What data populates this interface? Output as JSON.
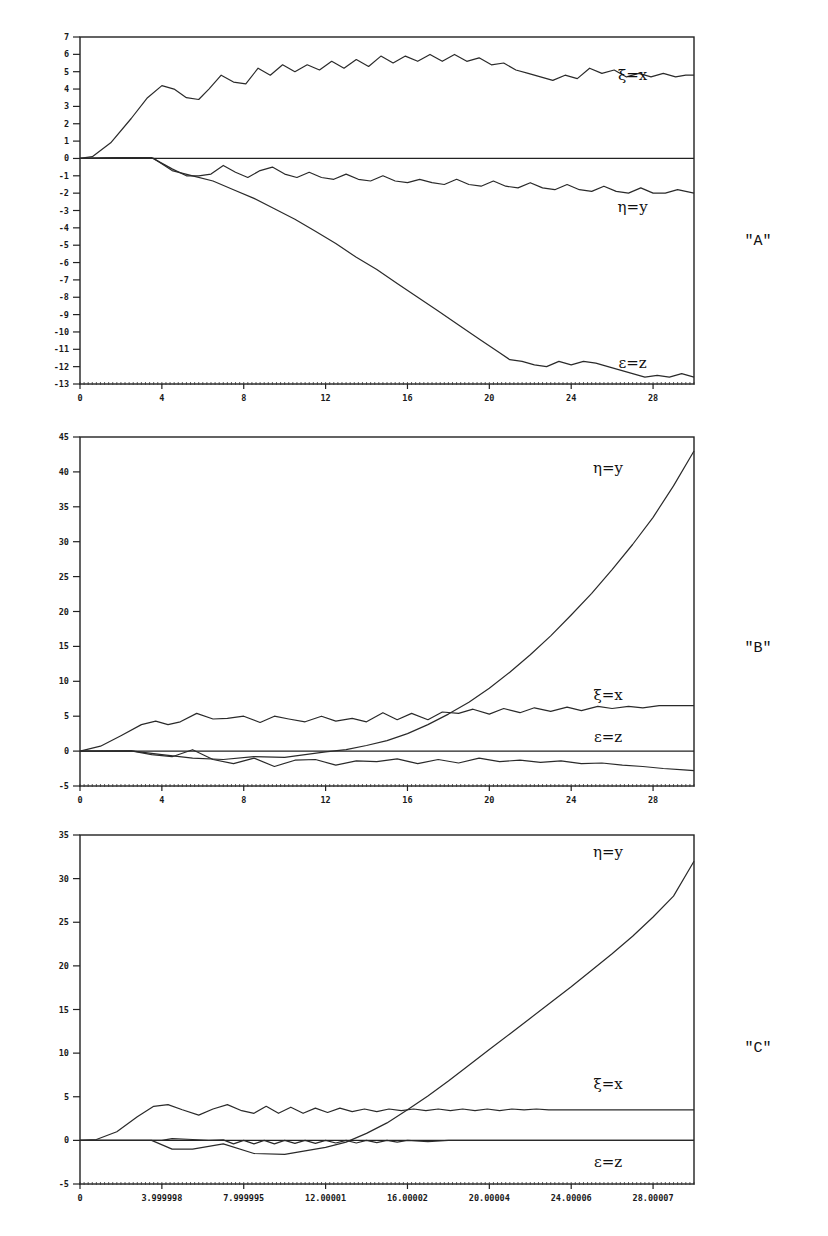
{
  "chart_data": [
    {
      "panel": "\"A\"",
      "type": "line",
      "frame": {
        "left": 80,
        "right": 694,
        "top": 37,
        "bottom": 384
      },
      "xlim": [
        0,
        30
      ],
      "ylim": [
        -13,
        7
      ],
      "x_ticks": [
        0,
        4,
        8,
        12,
        16,
        20,
        24,
        28
      ],
      "x_tick_labels": [
        "0",
        "4",
        "8",
        "12",
        "16",
        "20",
        "24",
        "28"
      ],
      "y_ticks": [
        7,
        6,
        5,
        4,
        3,
        2,
        1,
        0,
        -1,
        -2,
        -3,
        -4,
        -5,
        -6,
        -7,
        -8,
        -9,
        -10,
        -11,
        -12,
        -13
      ],
      "y_tick_labels": [
        "7",
        "6",
        "5",
        "4",
        "3",
        "2",
        "1",
        "0",
        "-1",
        "-2",
        "-3",
        "-4",
        "-5",
        "-6",
        "-7",
        "-8",
        "-9",
        "-10",
        "-11",
        "-12",
        "-13"
      ],
      "zero_line": true,
      "series": [
        {
          "name": "ξ=x",
          "label_pos": [
            0.9,
            4.8
          ],
          "x": [
            0,
            0.6,
            1.5,
            2.5,
            3.3,
            4.0,
            4.6,
            5.2,
            5.8,
            6.3,
            6.9,
            7.5,
            8.1,
            8.7,
            9.3,
            9.9,
            10.5,
            11.1,
            11.7,
            12.3,
            12.9,
            13.5,
            14.1,
            14.7,
            15.3,
            15.9,
            16.5,
            17.1,
            17.7,
            18.3,
            18.9,
            19.5,
            20.1,
            20.7,
            21.3,
            21.9,
            22.5,
            23.1,
            23.7,
            24.3,
            24.9,
            25.5,
            26.1,
            26.7,
            27.3,
            27.9,
            28.5,
            29.1,
            29.6,
            30
          ],
          "y": [
            0,
            0.1,
            0.9,
            2.3,
            3.5,
            4.2,
            4.0,
            3.5,
            3.4,
            4.0,
            4.8,
            4.4,
            4.3,
            5.2,
            4.8,
            5.4,
            5.0,
            5.4,
            5.1,
            5.6,
            5.2,
            5.7,
            5.3,
            5.9,
            5.5,
            5.9,
            5.6,
            6.0,
            5.6,
            6.0,
            5.6,
            5.8,
            5.4,
            5.5,
            5.1,
            4.9,
            4.7,
            4.5,
            4.8,
            4.6,
            5.2,
            4.9,
            5.1,
            4.7,
            4.9,
            4.7,
            4.9,
            4.7,
            4.8,
            4.8
          ]
        },
        {
          "name": "η=y",
          "label_pos": [
            0.9,
            -2.8
          ],
          "x": [
            0,
            2.0,
            3.5,
            4.5,
            5.2,
            5.8,
            6.4,
            7.0,
            7.6,
            8.2,
            8.8,
            9.4,
            10.0,
            10.6,
            11.2,
            11.8,
            12.4,
            13.0,
            13.6,
            14.2,
            14.8,
            15.4,
            16.0,
            16.6,
            17.2,
            17.8,
            18.4,
            19.0,
            19.6,
            20.2,
            20.8,
            21.4,
            22.0,
            22.6,
            23.2,
            23.8,
            24.4,
            25.0,
            25.6,
            26.2,
            26.8,
            27.4,
            28.0,
            28.6,
            29.2,
            30
          ],
          "y": [
            0,
            0.05,
            0.05,
            -0.6,
            -1.0,
            -1.0,
            -0.9,
            -0.4,
            -0.8,
            -1.1,
            -0.7,
            -0.5,
            -0.9,
            -1.1,
            -0.8,
            -1.1,
            -1.2,
            -0.9,
            -1.2,
            -1.3,
            -1.0,
            -1.3,
            -1.4,
            -1.2,
            -1.4,
            -1.5,
            -1.2,
            -1.5,
            -1.6,
            -1.3,
            -1.6,
            -1.7,
            -1.4,
            -1.7,
            -1.8,
            -1.5,
            -1.8,
            -1.9,
            -1.6,
            -1.9,
            -2.0,
            -1.7,
            -2.0,
            -2.0,
            -1.8,
            -2.0
          ]
        },
        {
          "name": "ε=z",
          "label_pos": [
            0.9,
            -11.8
          ],
          "x": [
            0,
            2.0,
            3.6,
            4.5,
            5.5,
            6.5,
            7.5,
            8.5,
            9.5,
            10.5,
            11.5,
            12.5,
            13.5,
            14.5,
            15.5,
            16.5,
            17.5,
            18.5,
            19.5,
            20.5,
            21.0,
            21.6,
            22.2,
            22.8,
            23.4,
            24.0,
            24.6,
            25.2,
            25.8,
            26.4,
            27.0,
            27.6,
            28.2,
            28.8,
            29.4,
            30
          ],
          "y": [
            0,
            0.05,
            0.0,
            -0.7,
            -1.0,
            -1.3,
            -1.8,
            -2.3,
            -2.9,
            -3.5,
            -4.2,
            -4.9,
            -5.7,
            -6.4,
            -7.2,
            -8.0,
            -8.8,
            -9.6,
            -10.4,
            -11.2,
            -11.6,
            -11.7,
            -11.9,
            -12.0,
            -11.7,
            -11.9,
            -11.7,
            -11.8,
            -12.0,
            -12.2,
            -12.4,
            -12.6,
            -12.5,
            -12.6,
            -12.4,
            -12.6
          ]
        }
      ]
    },
    {
      "panel": "\"B\"",
      "type": "line",
      "frame": {
        "left": 80,
        "right": 694,
        "top": 437,
        "bottom": 786
      },
      "xlim": [
        0,
        30
      ],
      "ylim": [
        -5,
        45
      ],
      "x_ticks": [
        0,
        4,
        8,
        12,
        16,
        20,
        24,
        28
      ],
      "x_tick_labels": [
        "0",
        "4",
        "8",
        "12",
        "16",
        "20",
        "24",
        "28"
      ],
      "y_ticks": [
        45,
        40,
        35,
        30,
        25,
        20,
        15,
        10,
        5,
        0,
        -5
      ],
      "y_tick_labels": [
        "45",
        "40",
        "35",
        "30",
        "25",
        "20",
        "15",
        "10",
        "5",
        "0",
        "-5"
      ],
      "zero_line": true,
      "series": [
        {
          "name": "η=y",
          "label_pos": [
            0.86,
            40.5
          ],
          "x": [
            0,
            2.5,
            4.0,
            5.5,
            7.0,
            8.5,
            10.0,
            11.0,
            12.0,
            13.0,
            14.0,
            15.0,
            16.0,
            17.0,
            18.0,
            19.0,
            20.0,
            21.0,
            22.0,
            23.0,
            24.0,
            25.0,
            26.0,
            27.0,
            28.0,
            29.0,
            30
          ],
          "y": [
            0,
            0.05,
            -0.5,
            -1.0,
            -1.2,
            -0.8,
            -0.9,
            -0.5,
            -0.1,
            0.2,
            0.8,
            1.5,
            2.5,
            3.8,
            5.3,
            7.0,
            9.0,
            11.3,
            13.8,
            16.5,
            19.5,
            22.6,
            26.0,
            29.6,
            33.5,
            38.0,
            43.0
          ]
        },
        {
          "name": "ξ=x",
          "label_pos": [
            0.86,
            8.0
          ],
          "x": [
            0,
            1.0,
            2.0,
            3.0,
            3.7,
            4.3,
            4.9,
            5.7,
            6.5,
            7.2,
            8.0,
            8.8,
            9.5,
            10.2,
            11.0,
            11.8,
            12.5,
            13.3,
            14.0,
            14.8,
            15.5,
            16.2,
            17.0,
            17.7,
            18.5,
            19.2,
            20.0,
            20.7,
            21.5,
            22.2,
            23.0,
            23.8,
            24.5,
            25.3,
            26.0,
            26.8,
            27.5,
            28.3,
            29.0,
            30
          ],
          "y": [
            0,
            0.7,
            2.2,
            3.8,
            4.3,
            3.8,
            4.2,
            5.4,
            4.6,
            4.7,
            5.0,
            4.1,
            5.0,
            4.6,
            4.2,
            5.0,
            4.3,
            4.7,
            4.2,
            5.5,
            4.5,
            5.4,
            4.5,
            5.6,
            5.4,
            6.0,
            5.3,
            6.1,
            5.5,
            6.2,
            5.7,
            6.3,
            5.8,
            6.4,
            6.1,
            6.4,
            6.2,
            6.5,
            6.5,
            6.5
          ]
        },
        {
          "name": "ε=z",
          "label_pos": [
            0.86,
            2.0
          ],
          "x": [
            0,
            2.5,
            3.5,
            4.5,
            5.5,
            6.5,
            7.5,
            8.5,
            9.5,
            10.5,
            11.5,
            12.5,
            13.5,
            14.5,
            15.5,
            16.5,
            17.5,
            18.5,
            19.5,
            20.5,
            21.5,
            22.5,
            23.5,
            24.5,
            25.5,
            26.5,
            27.5,
            28.5,
            29.5,
            30
          ],
          "y": [
            0,
            0.05,
            -0.5,
            -0.8,
            0.2,
            -1.2,
            -1.8,
            -1.0,
            -2.2,
            -1.3,
            -1.2,
            -2.0,
            -1.4,
            -1.5,
            -1.1,
            -1.8,
            -1.2,
            -1.7,
            -1.0,
            -1.5,
            -1.3,
            -1.6,
            -1.4,
            -1.8,
            -1.7,
            -2.0,
            -2.2,
            -2.5,
            -2.7,
            -2.8
          ]
        }
      ]
    },
    {
      "panel": "\"C\"",
      "type": "line",
      "frame": {
        "left": 80,
        "right": 694,
        "top": 835,
        "bottom": 1184
      },
      "xlim": [
        0,
        30
      ],
      "ylim": [
        -5,
        35
      ],
      "x_ticks": [
        0,
        3.999998,
        7.999995,
        12.00001,
        16.00002,
        20.00004,
        24.00006,
        28.00007
      ],
      "x_tick_labels": [
        "0",
        "3.999998",
        "7.999995",
        "12.00001",
        "16.00002",
        "20.00004",
        "24.00006",
        "28.00007"
      ],
      "y_ticks": [
        35,
        30,
        25,
        20,
        15,
        10,
        5,
        0,
        -5
      ],
      "y_tick_labels": [
        "35",
        "30",
        "25",
        "20",
        "15",
        "10",
        "5",
        "0",
        "-5"
      ],
      "zero_line": true,
      "series": [
        {
          "name": "η=y",
          "label_pos": [
            0.86,
            33.0
          ],
          "x": [
            0,
            3.5,
            4.5,
            5.5,
            7.0,
            8.5,
            10.0,
            11.0,
            12.0,
            13.0,
            14.0,
            15.0,
            16.0,
            17.0,
            18.0,
            19.0,
            20.0,
            21.0,
            22.0,
            23.0,
            24.0,
            25.0,
            26.0,
            27.0,
            28.0,
            29.0,
            30
          ],
          "y": [
            0,
            0.0,
            -1.0,
            -1.0,
            -0.4,
            -1.5,
            -1.6,
            -1.2,
            -0.8,
            -0.2,
            0.8,
            2.0,
            3.5,
            5.1,
            6.8,
            8.6,
            10.4,
            12.2,
            14.0,
            15.8,
            17.6,
            19.5,
            21.4,
            23.4,
            25.6,
            28.0,
            32.0
          ]
        },
        {
          "name": "ξ=x",
          "label_pos": [
            0.86,
            6.5
          ],
          "x": [
            0,
            0.8,
            1.8,
            2.8,
            3.6,
            4.3,
            5.0,
            5.8,
            6.5,
            7.2,
            7.9,
            8.5,
            9.1,
            9.7,
            10.3,
            10.9,
            11.5,
            12.1,
            12.7,
            13.3,
            13.9,
            14.5,
            15.1,
            15.7,
            16.3,
            16.9,
            17.5,
            18.1,
            18.7,
            19.3,
            19.9,
            20.5,
            21.1,
            21.7,
            22.3,
            22.9,
            30
          ],
          "y": [
            0,
            0.1,
            1.0,
            2.7,
            3.9,
            4.1,
            3.5,
            2.9,
            3.6,
            4.1,
            3.4,
            3.1,
            3.9,
            3.1,
            3.8,
            3.1,
            3.7,
            3.2,
            3.7,
            3.3,
            3.6,
            3.3,
            3.6,
            3.4,
            3.6,
            3.4,
            3.6,
            3.4,
            3.6,
            3.4,
            3.6,
            3.4,
            3.6,
            3.5,
            3.6,
            3.5,
            3.5
          ]
        },
        {
          "name": "ε=z",
          "label_pos": [
            0.86,
            -2.5
          ],
          "x": [
            0,
            3.0,
            4.0,
            4.5,
            5.5,
            6.3,
            7.0,
            7.5,
            8.0,
            8.5,
            9.0,
            9.5,
            10.0,
            10.5,
            11.0,
            11.5,
            12.0,
            12.5,
            13.0,
            13.5,
            14.0,
            14.5,
            15.0,
            15.5,
            16.0,
            17.0,
            18.0,
            30
          ],
          "y": [
            0,
            0.0,
            0.0,
            0.2,
            0.1,
            0.0,
            0.05,
            -0.4,
            0.0,
            -0.4,
            0.0,
            -0.4,
            0.0,
            -0.35,
            0.0,
            -0.35,
            0.0,
            -0.3,
            0.0,
            -0.3,
            0.0,
            -0.25,
            0.0,
            -0.2,
            0.0,
            -0.15,
            0.0,
            0.0
          ]
        }
      ]
    }
  ],
  "panels": [
    {
      "id": "A",
      "label": "\"A\""
    },
    {
      "id": "B",
      "label": "\"B\""
    },
    {
      "id": "C",
      "label": "\"C\""
    }
  ]
}
